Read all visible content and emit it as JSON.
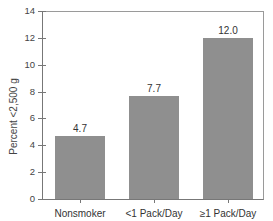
{
  "chart_data": {
    "type": "bar",
    "title": "",
    "xlabel": "",
    "ylabel": "Percent <2,500 g",
    "categories": [
      "Nonsmoker",
      "<1 Pack/Day",
      "≥1 Pack/Day"
    ],
    "values": [
      4.7,
      7.7,
      12.0
    ],
    "value_labels": [
      "4.7",
      "7.7",
      "12.0"
    ],
    "ylim": [
      0,
      14
    ],
    "yticks": [
      "0",
      "2",
      "4",
      "6",
      "8",
      "10",
      "12",
      "14"
    ],
    "grid": false,
    "legend": null,
    "bar_color": "#8f8f8f"
  }
}
